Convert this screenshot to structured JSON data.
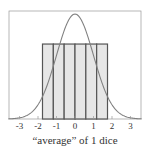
{
  "chart_data": {
    "type": "bar",
    "title": "",
    "xlabel": "“average” of 1 dice",
    "ylabel": "",
    "xlim": [
      -3.6,
      3.6
    ],
    "xticks": [
      "-3",
      "-2",
      "-1",
      "0",
      "1",
      "2",
      "3"
    ],
    "grid": false,
    "legend": null,
    "series": [
      {
        "name": "standardized 1-dice histogram",
        "kind": "bar",
        "bin_edges": [
          -1.464,
          -0.878,
          -0.293,
          0.293,
          0.878,
          1.464
        ],
        "bin_edges_full": [
          -1.757,
          -1.171,
          -0.586,
          0.0,
          0.586,
          1.171,
          1.757
        ],
        "values": [
          0.285,
          0.285,
          0.285,
          0.285,
          0.285,
          0.285
        ],
        "color": "#e8e8e8",
        "edge_color": "#555555"
      },
      {
        "name": "standard normal density",
        "kind": "line",
        "peak": 0.399,
        "color": "#777777"
      }
    ]
  },
  "colors": {
    "frame": "#999999",
    "bar_fill": "#e6e6e6",
    "bar_edge": "#555555",
    "curve": "#808080",
    "text": "#333333"
  }
}
